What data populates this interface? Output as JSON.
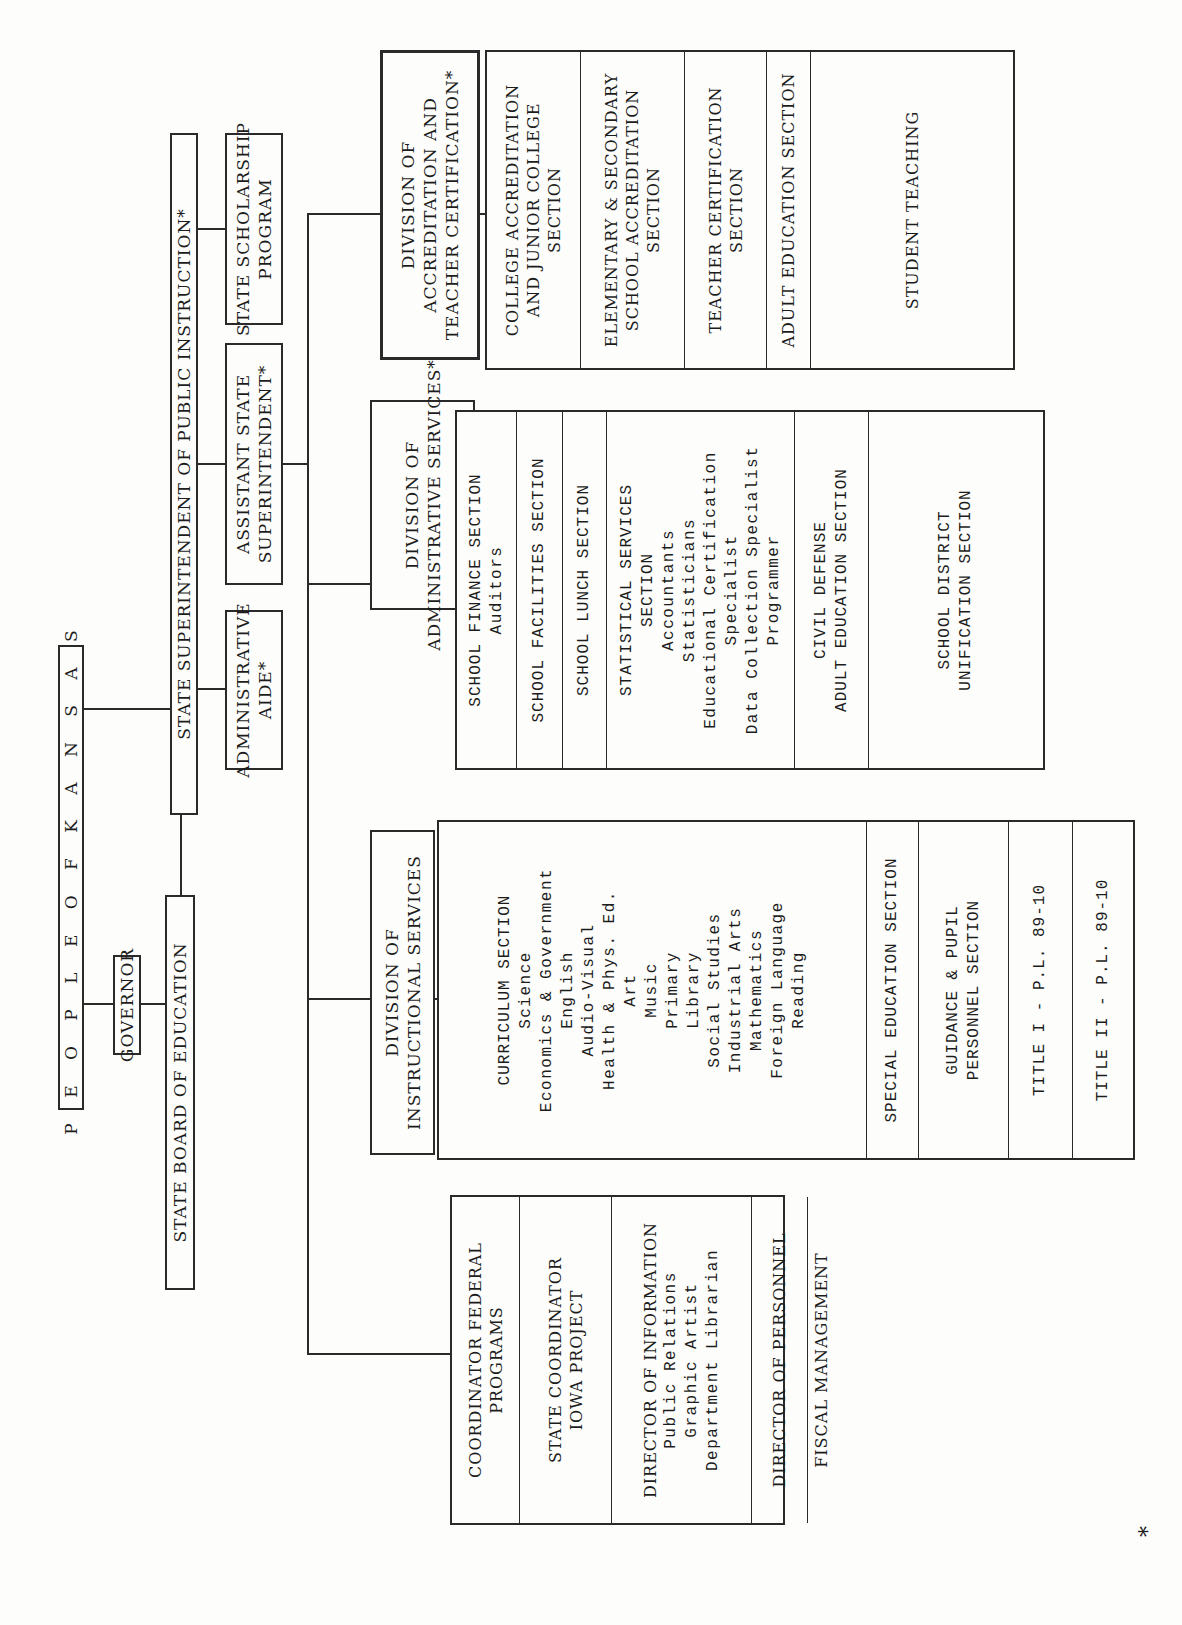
{
  "chart": {
    "top": {
      "people": "P E O P L E   O F   K A N S A S",
      "governor": "GOVERNOR",
      "state_board": "STATE BOARD OF EDUCATION",
      "superintendent": "STATE SUPERINTENDENT OF PUBLIC INSTRUCTION*"
    },
    "staff": {
      "admin_aide": [
        "ADMINISTRATIVE",
        "AIDE*"
      ],
      "assistant_supt": [
        "ASSISTANT STATE",
        "SUPERINTENDENT*"
      ],
      "scholarship": [
        "STATE SCHOLARSHIP",
        "PROGRAM"
      ]
    },
    "divisions": {
      "accreditation": {
        "title": [
          "DIVISION OF",
          "ACCREDITATION AND",
          "TEACHER CERTIFICATION*"
        ],
        "sections": [
          [
            "COLLEGE ACCREDITATION",
            "AND JUNIOR COLLEGE",
            "SECTION"
          ],
          [
            "ELEMENTARY & SECONDARY",
            "SCHOOL ACCREDITATION",
            "SECTION"
          ],
          [
            "TEACHER CERTIFICATION",
            "SECTION"
          ],
          [
            "ADULT EDUCATION SECTION"
          ],
          [
            "STUDENT TEACHING"
          ]
        ]
      },
      "administrative": {
        "title": [
          "DIVISION OF",
          "ADMINISTRATIVE SERVICES*"
        ],
        "sections": [
          {
            "head": [
              "SCHOOL FINANCE SECTION"
            ],
            "staff": [
              "Auditors"
            ]
          },
          {
            "head": [
              "SCHOOL FACILITIES SECTION"
            ],
            "staff": []
          },
          {
            "head": [
              "SCHOOL LUNCH SECTION"
            ],
            "staff": []
          },
          {
            "head": [
              "STATISTICAL SERVICES",
              "SECTION"
            ],
            "staff": [
              "Accountants",
              "Statisticians",
              "Educational Certification",
              "Specialist",
              "Data Collection Specialist",
              "Programmer"
            ]
          },
          {
            "head": [
              "CIVIL DEFENSE",
              "ADULT EDUCATION SECTION"
            ],
            "staff": []
          },
          {
            "head": [
              "SCHOOL DISTRICT",
              "UNIFICATION SECTION"
            ],
            "staff": []
          }
        ]
      },
      "instructional": {
        "title": [
          "DIVISION OF",
          "INSTRUCTIONAL SERVICES"
        ],
        "sections": [
          {
            "head": [
              "CURRICULUM SECTION"
            ],
            "staff": [
              "Science",
              "Economics & Government",
              "English",
              "Audio-Visual",
              "Health & Phys. Ed.",
              "Art",
              "Music",
              "Primary",
              "Library",
              "Social Studies",
              "Industrial Arts",
              "Mathematics",
              "Foreign Language",
              "Reading"
            ]
          },
          {
            "head": [
              "SPECIAL EDUCATION SECTION"
            ],
            "staff": []
          },
          {
            "head": [
              "GUIDANCE & PUPIL",
              "PERSONNEL SECTION"
            ],
            "staff": []
          },
          {
            "head": [
              "TITLE I - P.L. 89-10"
            ],
            "staff": []
          },
          {
            "head": [
              "TITLE II - P.L. 89-10"
            ],
            "staff": []
          }
        ]
      }
    },
    "direct_units": [
      {
        "head": [
          "COORDINATOR FEDERAL",
          "PROGRAMS"
        ],
        "staff": []
      },
      {
        "head": [
          "STATE COORDINATOR",
          "IOWA PROJECT"
        ],
        "staff": []
      },
      {
        "head": [
          "DIRECTOR OF INFORMATION"
        ],
        "staff": [
          "Public Relations",
          "Graphic Artist",
          "Department Librarian"
        ]
      },
      {
        "head": [
          "DIRECTOR OF PERSONNEL"
        ],
        "staff": []
      },
      {
        "head": [
          "FISCAL MANAGEMENT"
        ],
        "staff": []
      }
    ],
    "footnote_marker": "*"
  }
}
